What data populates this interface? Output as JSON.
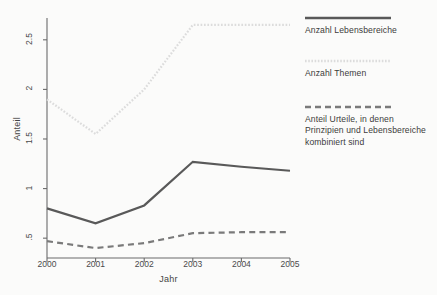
{
  "figure": {
    "background_color": "#fbfbfa"
  },
  "axes": {
    "y_title": "Anteil",
    "x_title": "Jahr",
    "y_ticks": [
      ".5",
      "1",
      "1.5",
      "2",
      "2.5"
    ],
    "x_ticks": [
      "2000",
      "2001",
      "2002",
      "2003",
      "2004",
      "2005"
    ]
  },
  "legend": {
    "entries": [
      {
        "label": "Anzahl Lebensbereiche",
        "style": "solid",
        "color": "#595959",
        "sample_name": "legend-sample-solid-line"
      },
      {
        "label": "Anzahl Themen",
        "style": "dotted",
        "color": "#dcdcdc",
        "sample_name": "legend-sample-dotted-line"
      },
      {
        "label": "Anteil Urteile, in denen Prinzipien und Lebensbereiche kombiniert sind",
        "label_line_1": "Anteil Urteile, in denen",
        "label_line_2": "Prinzipien und Lebensbereiche",
        "label_line_3": "kombiniert sind",
        "style": "dashed",
        "color": "#7a7a7a",
        "sample_name": "legend-sample-dashed-line"
      }
    ]
  },
  "chart_data": {
    "type": "line",
    "title": "",
    "xlabel": "Jahr",
    "ylabel": "Anteil",
    "x": [
      2000,
      2001,
      2002,
      2003,
      2004,
      2005
    ],
    "xlim": [
      2000,
      2005
    ],
    "ylim": [
      0.3,
      2.72
    ],
    "y_tick_values": [
      0.5,
      1,
      1.5,
      2,
      2.5
    ],
    "y_tick_labels": [
      ".5",
      "1",
      "1.5",
      "2",
      "2.5"
    ],
    "x_tick_labels": [
      "2000",
      "2001",
      "2002",
      "2003",
      "2004",
      "2005"
    ],
    "grid": false,
    "legend_position": "right",
    "series": [
      {
        "name": "Anzahl Lebensbereiche",
        "style": "solid",
        "color": "#595959",
        "width": 2.2,
        "values": [
          0.8,
          0.65,
          0.83,
          1.27,
          1.22,
          1.18
        ]
      },
      {
        "name": "Anzahl Themen",
        "style": "dotted",
        "color": "#dcdcdc",
        "width": 2.2,
        "values": [
          1.9,
          1.55,
          2.0,
          2.65,
          2.65,
          2.65
        ]
      },
      {
        "name": "Anteil Urteile, in denen Prinzipien und Lebensbereiche kombiniert sind",
        "style": "dashed",
        "color": "#7a7a7a",
        "width": 2.2,
        "values": [
          0.47,
          0.4,
          0.45,
          0.55,
          0.56,
          0.56
        ]
      }
    ]
  }
}
